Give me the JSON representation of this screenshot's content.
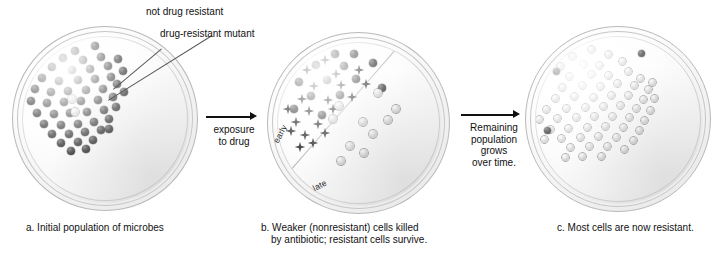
{
  "figure": {
    "callouts": [
      {
        "id": "not-drug-resistant",
        "text": "not drug resistant"
      },
      {
        "id": "drug-resistant-mutant",
        "text": "drug-resistant mutant"
      }
    ],
    "arrows": [
      {
        "id": "exposure-to-drug",
        "lines": [
          "exposure",
          "to drug"
        ]
      },
      {
        "id": "remaining-population-grows",
        "lines": [
          "Remaining",
          "population",
          "grows",
          "over time."
        ]
      }
    ],
    "panels": [
      {
        "id": "panel-a",
        "caption": "a. Initial population of microbes",
        "caption_lines": [
          "a. Initial population of microbes"
        ],
        "zone_labels": [],
        "counts": {
          "susceptible": 50,
          "resistant": 2,
          "killed": 0
        }
      },
      {
        "id": "panel-b",
        "caption": "b. Weaker (nonresistant) cells killed by antibiotic; resistant cells survive.",
        "caption_lines": [
          "b. Weaker (nonresistant) cells killed",
          "by antibiotic; resistant cells survive."
        ],
        "zone_labels": [
          {
            "id": "early",
            "text": "early"
          },
          {
            "id": "late",
            "text": "late"
          }
        ],
        "counts": {
          "susceptible": 13,
          "resistant": 9,
          "killed": 22
        }
      },
      {
        "id": "panel-c",
        "caption": "c. Most cells are now resistant.",
        "caption_lines": [
          "c. Most cells are now resistant."
        ],
        "zone_labels": [],
        "counts": {
          "susceptible": 4,
          "resistant": 62,
          "killed": 0
        }
      }
    ],
    "colors": {
      "susceptible_cell": "#141414",
      "resistant_cell": "#cfcfcf",
      "killed_cell": "#0b0b0b",
      "dish_rim": "#b9b9b9",
      "agar": "#f7f7f7",
      "text": "#111111",
      "leader_line": "#5a5a5a",
      "divider": "#a9a9a9",
      "background": "#ffffff"
    }
  },
  "chart_data": {
    "type": "diagram",
    "stages": [
      {
        "label": "a. Initial population of microbes",
        "susceptible": 50,
        "resistant": 2,
        "killed": 0
      },
      {
        "label": "b. Weaker (nonresistant) cells killed by antibiotic; resistant cells survive.",
        "susceptible": 13,
        "resistant": 9,
        "killed": 22
      },
      {
        "label": "c. Most cells are now resistant.",
        "susceptible": 4,
        "resistant": 62,
        "killed": 0
      }
    ],
    "transitions": [
      "exposure to drug",
      "Remaining population grows over time."
    ],
    "legend": [
      "not drug resistant",
      "drug-resistant mutant"
    ]
  },
  "cells": {
    "panel_a_dark": [
      [
        52,
        14
      ],
      [
        72,
        9
      ],
      [
        40,
        21
      ],
      [
        60,
        23
      ],
      [
        78,
        20
      ],
      [
        29,
        30
      ],
      [
        49,
        33
      ],
      [
        67,
        32
      ],
      [
        85,
        29
      ],
      [
        95,
        22
      ],
      [
        19,
        41
      ],
      [
        36,
        44
      ],
      [
        55,
        43
      ],
      [
        72,
        42
      ],
      [
        88,
        40
      ],
      [
        100,
        34
      ],
      [
        12,
        52
      ],
      [
        28,
        55
      ],
      [
        45,
        54
      ],
      [
        63,
        53
      ],
      [
        80,
        52
      ],
      [
        94,
        47
      ],
      [
        8,
        64
      ],
      [
        24,
        66
      ],
      [
        41,
        65
      ],
      [
        58,
        64
      ],
      [
        75,
        63
      ],
      [
        90,
        60
      ],
      [
        101,
        55
      ],
      [
        14,
        76
      ],
      [
        31,
        77
      ],
      [
        47,
        76
      ],
      [
        64,
        75
      ],
      [
        81,
        73
      ],
      [
        93,
        70
      ],
      [
        21,
        87
      ],
      [
        38,
        88
      ],
      [
        55,
        87
      ],
      [
        71,
        85
      ],
      [
        86,
        82
      ],
      [
        29,
        97
      ],
      [
        46,
        97
      ],
      [
        62,
        95
      ],
      [
        78,
        93
      ],
      [
        38,
        106
      ],
      [
        55,
        105
      ],
      [
        70,
        103
      ],
      [
        48,
        114
      ],
      [
        63,
        112
      ],
      [
        86,
        92
      ]
    ],
    "panel_a_light": [
      [
        49,
        62
      ],
      [
        52,
        75
      ]
    ],
    "panel_b_dark": [
      [
        57,
        11
      ],
      [
        76,
        11
      ],
      [
        38,
        22
      ],
      [
        66,
        23
      ],
      [
        95,
        20
      ],
      [
        21,
        39
      ],
      [
        49,
        37
      ],
      [
        78,
        36
      ],
      [
        104,
        45
      ],
      [
        33,
        53
      ],
      [
        62,
        52
      ],
      [
        16,
        66
      ],
      [
        44,
        72
      ]
    ],
    "panel_b_dead": [
      [
        47,
        17
      ],
      [
        29,
        27
      ],
      [
        81,
        27
      ],
      [
        58,
        31
      ],
      [
        12,
        40
      ],
      [
        36,
        43
      ],
      [
        63,
        42
      ],
      [
        88,
        41
      ],
      [
        5,
        52
      ],
      [
        24,
        56
      ],
      [
        50,
        57
      ],
      [
        74,
        54
      ],
      [
        10,
        66
      ],
      [
        31,
        68
      ],
      [
        55,
        66
      ],
      [
        18,
        79
      ],
      [
        40,
        81
      ],
      [
        27,
        92
      ],
      [
        47,
        90
      ],
      [
        13,
        88
      ],
      [
        35,
        100
      ],
      [
        22,
        104
      ]
    ],
    "panel_b_light": [
      [
        61,
        63
      ],
      [
        55,
        76
      ],
      [
        100,
        50
      ],
      [
        118,
        66
      ],
      [
        110,
        77
      ],
      [
        85,
        79
      ],
      [
        95,
        91
      ],
      [
        72,
        103
      ],
      [
        86,
        110
      ],
      [
        63,
        118
      ]
    ],
    "panel_c_light": [
      [
        55,
        12
      ],
      [
        36,
        19
      ],
      [
        72,
        17
      ],
      [
        24,
        29
      ],
      [
        47,
        27
      ],
      [
        63,
        28
      ],
      [
        86,
        24
      ],
      [
        13,
        40
      ],
      [
        33,
        39
      ],
      [
        55,
        37
      ],
      [
        72,
        38
      ],
      [
        92,
        34
      ],
      [
        104,
        41
      ],
      [
        8,
        51
      ],
      [
        26,
        50
      ],
      [
        46,
        48
      ],
      [
        64,
        49
      ],
      [
        81,
        46
      ],
      [
        98,
        48
      ],
      [
        112,
        52
      ],
      [
        4,
        62
      ],
      [
        19,
        61
      ],
      [
        38,
        59
      ],
      [
        57,
        60
      ],
      [
        75,
        58
      ],
      [
        92,
        58
      ],
      [
        107,
        62
      ],
      [
        10,
        72
      ],
      [
        30,
        71
      ],
      [
        49,
        70
      ],
      [
        67,
        69
      ],
      [
        84,
        68
      ],
      [
        100,
        71
      ],
      [
        114,
        73
      ],
      [
        3,
        82
      ],
      [
        21,
        81
      ],
      [
        40,
        80
      ],
      [
        58,
        79
      ],
      [
        76,
        79
      ],
      [
        93,
        80
      ],
      [
        108,
        83
      ],
      [
        14,
        92
      ],
      [
        32,
        91
      ],
      [
        51,
        90
      ],
      [
        69,
        89
      ],
      [
        87,
        90
      ],
      [
        103,
        93
      ],
      [
        8,
        102
      ],
      [
        25,
        101
      ],
      [
        44,
        100
      ],
      [
        62,
        99
      ],
      [
        80,
        100
      ],
      [
        97,
        103
      ],
      [
        34,
        110
      ],
      [
        53,
        109
      ],
      [
        71,
        109
      ],
      [
        88,
        112
      ],
      [
        46,
        119
      ],
      [
        65,
        119
      ],
      [
        118,
        61
      ],
      [
        116,
        45
      ],
      [
        29,
        120
      ]
    ],
    "panel_c_dark": [
      [
        60,
        6
      ],
      [
        20,
        34
      ],
      [
        105,
        16
      ],
      [
        11,
        93
      ]
    ]
  }
}
